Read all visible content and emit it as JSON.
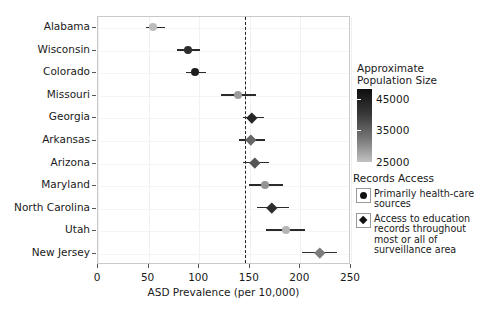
{
  "chart_data": {
    "type": "scatter",
    "title": "",
    "xlabel": "ASD Prevalence (per 10,000)",
    "ylabel": "",
    "xlim": [
      0,
      250
    ],
    "xticks": [
      0,
      50,
      100,
      150,
      200,
      250
    ],
    "xticklabels": [
      "0",
      "50",
      "100",
      "150",
      "200",
      "250"
    ],
    "categories": [
      "Alabama",
      "Wisconsin",
      "Colorado",
      "Missouri",
      "Georgia",
      "Arkansas",
      "Arizona",
      "Maryland",
      "North Carolina",
      "Utah",
      "New Jersey"
    ],
    "grid": true,
    "reference_line": {
      "value": 145,
      "style": "dashed",
      "color": "#222222"
    },
    "points": [
      {
        "state": "Alabama",
        "value": 55,
        "low": 48,
        "high": 67,
        "marker": "circle",
        "population": 26000
      },
      {
        "state": "Wisconsin",
        "value": 90,
        "low": 79,
        "high": 102,
        "marker": "circle",
        "population": 44000
      },
      {
        "state": "Colorado",
        "value": 97,
        "low": 88,
        "high": 108,
        "marker": "circle",
        "population": 46000
      },
      {
        "state": "Missouri",
        "value": 139,
        "low": 123,
        "high": 157,
        "marker": "circle",
        "population": 30000
      },
      {
        "state": "Georgia",
        "value": 153,
        "low": 144,
        "high": 165,
        "marker": "diamond",
        "population": 45000
      },
      {
        "state": "Arkansas",
        "value": 152,
        "low": 140,
        "high": 166,
        "marker": "diamond",
        "population": 37000
      },
      {
        "state": "Arizona",
        "value": 156,
        "low": 144,
        "high": 170,
        "marker": "diamond",
        "population": 39000
      },
      {
        "state": "Maryland",
        "value": 166,
        "low": 150,
        "high": 184,
        "marker": "circle",
        "population": 31000
      },
      {
        "state": "North Carolina",
        "value": 173,
        "low": 158,
        "high": 190,
        "marker": "diamond",
        "population": 44000
      },
      {
        "state": "Utah",
        "value": 187,
        "low": 167,
        "high": 206,
        "marker": "circle",
        "population": 27000
      },
      {
        "state": "New Jersey",
        "value": 220,
        "low": 203,
        "high": 237,
        "marker": "diamond",
        "population": 34000
      }
    ],
    "colorbar": {
      "title": "Approximate\nPopulation Size",
      "ticks": [
        45000,
        35000,
        25000
      ],
      "ticklabels": [
        "45000",
        "35000",
        "25000"
      ],
      "range": [
        25000,
        48000
      ],
      "color_high": "#0d0d0d",
      "color_low": "#c2c2c2"
    },
    "legend": {
      "title": "Records Access",
      "items": [
        {
          "marker": "circle",
          "label": "Primarily health-care\nsources"
        },
        {
          "marker": "diamond",
          "label": "Access to education\nrecords throughout\nmost or all of\nsurveillance area"
        }
      ],
      "position": "right"
    }
  }
}
